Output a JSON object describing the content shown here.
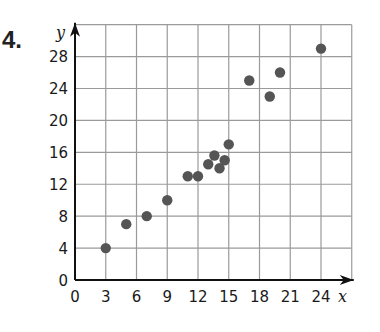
{
  "problem_number": "4.",
  "chart_data": {
    "type": "scatter",
    "title": "",
    "xlabel": "x",
    "ylabel": "y",
    "xlim": [
      0,
      27
    ],
    "ylim": [
      0,
      32
    ],
    "grid": true,
    "legend": null,
    "x_ticks": [
      0,
      3,
      6,
      9,
      12,
      15,
      18,
      21,
      24
    ],
    "y_ticks": [
      0,
      4,
      8,
      12,
      16,
      20,
      24,
      28
    ],
    "x_tick_labels": [
      "0",
      "3",
      "6",
      "9",
      "12",
      "15",
      "18",
      "21",
      "24"
    ],
    "y_tick_labels": [
      "0",
      "4",
      "8",
      "12",
      "16",
      "20",
      "24",
      "28"
    ],
    "series": [
      {
        "name": "data",
        "color": "#555555",
        "points": [
          [
            3,
            4
          ],
          [
            5,
            7
          ],
          [
            7,
            8
          ],
          [
            9,
            10
          ],
          [
            11,
            13
          ],
          [
            12,
            13
          ],
          [
            13,
            14.5
          ],
          [
            13.6,
            15.6
          ],
          [
            14.1,
            14
          ],
          [
            14.6,
            15
          ],
          [
            15,
            17
          ],
          [
            17,
            25
          ],
          [
            19,
            23
          ],
          [
            20,
            26
          ],
          [
            24,
            29
          ]
        ]
      }
    ]
  },
  "colors": {
    "grid": "#9a9a9a",
    "axis": "#111111",
    "point": "#555555"
  }
}
